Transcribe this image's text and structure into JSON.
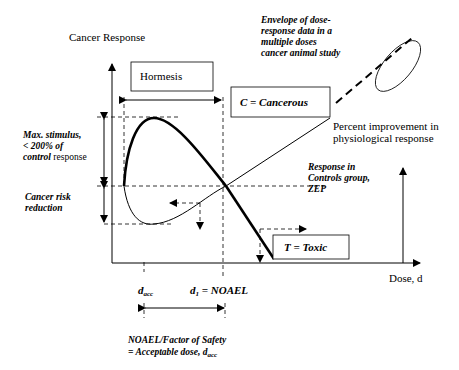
{
  "diagram": {
    "type": "dose-response hormesis diagram",
    "y_axis_label": "Cancer Response",
    "x_axis_label": "Dose, d",
    "boxes": {
      "hormesis": "Hormesis",
      "cancerous": "C = Cancerous",
      "toxic": "T = Toxic"
    },
    "annotations": {
      "envelope": [
        "Envelope of dose-",
        "response data in a",
        "multiple doses",
        "cancer animal study"
      ],
      "percent_improvement": [
        "Percent improvement in",
        "physiological response"
      ],
      "max_stimulus_line1": "Max. stimulus,",
      "max_stimulus_line2": "< 200% of",
      "max_stimulus_line3_italic": "control",
      "max_stimulus_line3_rest": " response",
      "cancer_risk": [
        "Cancer risk",
        "reduction"
      ],
      "controls": [
        "Response in",
        "Controls group,",
        "ZEP"
      ],
      "d_acc_main": "d",
      "d_acc_sub": "acc",
      "noael_main": "d",
      "noael_sub": "1",
      "noael_rest": " = NOAEL",
      "safety_line1": "NOAEL/Factor of Safety",
      "safety_line2_main": "= Acceptable dose, d",
      "safety_line2_sub": "acc"
    }
  }
}
